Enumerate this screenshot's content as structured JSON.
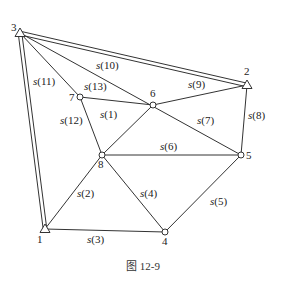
{
  "caption": "图 12-9",
  "points": [
    {
      "id": "1",
      "label": "1",
      "type": "control",
      "x": 45,
      "y": 229,
      "lx": 37,
      "ly": 243
    },
    {
      "id": "2",
      "label": "2",
      "type": "control",
      "x": 247,
      "y": 85,
      "lx": 244,
      "ly": 75
    },
    {
      "id": "3",
      "label": "3",
      "type": "control",
      "x": 20,
      "y": 33,
      "lx": 11,
      "ly": 31
    },
    {
      "id": "4",
      "label": "4",
      "type": "unknown",
      "x": 165,
      "y": 232,
      "lx": 162,
      "ly": 245
    },
    {
      "id": "5",
      "label": "5",
      "type": "unknown",
      "x": 241,
      "y": 155,
      "lx": 246,
      "ly": 159
    },
    {
      "id": "6",
      "label": "6",
      "type": "unknown",
      "x": 153,
      "y": 105,
      "lx": 150,
      "ly": 97
    },
    {
      "id": "7",
      "label": "7",
      "type": "unknown",
      "x": 80,
      "y": 97,
      "lx": 69,
      "ly": 101
    },
    {
      "id": "8",
      "label": "8",
      "type": "unknown",
      "x": 102,
      "y": 155,
      "lx": 98,
      "ly": 168
    }
  ],
  "edges": [
    {
      "from": "7",
      "to": "6",
      "style": "single"
    },
    {
      "from": "6",
      "to": "8",
      "style": "single"
    },
    {
      "from": "8",
      "to": "1",
      "style": "single"
    },
    {
      "from": "1",
      "to": "4",
      "style": "single"
    },
    {
      "from": "8",
      "to": "4",
      "style": "single"
    },
    {
      "from": "4",
      "to": "5",
      "style": "single"
    },
    {
      "from": "8",
      "to": "5",
      "style": "single"
    },
    {
      "from": "3",
      "to": "5",
      "style": "single"
    },
    {
      "from": "6",
      "to": "2",
      "style": "single"
    },
    {
      "from": "5",
      "to": "2",
      "style": "single"
    },
    {
      "from": "3",
      "to": "7",
      "style": "single"
    },
    {
      "from": "7",
      "to": "8",
      "style": "single"
    },
    {
      "from": "3",
      "to": "2",
      "style": "double"
    },
    {
      "from": "3",
      "to": "1",
      "style": "double"
    }
  ],
  "edge_labels": [
    {
      "name": "s",
      "num": "(1)",
      "x": 100,
      "y": 118
    },
    {
      "name": "s",
      "num": "(2)",
      "x": 77,
      "y": 197
    },
    {
      "name": "s",
      "num": "(3)",
      "x": 87,
      "y": 243
    },
    {
      "name": "s",
      "num": "(4)",
      "x": 140,
      "y": 197
    },
    {
      "name": "s",
      "num": "(5)",
      "x": 210,
      "y": 205
    },
    {
      "name": "s",
      "num": "(6)",
      "x": 160,
      "y": 150
    },
    {
      "name": "s",
      "num": "(7)",
      "x": 197,
      "y": 124
    },
    {
      "name": "s",
      "num": "(8)",
      "x": 248,
      "y": 119
    },
    {
      "name": "s",
      "num": "(9)",
      "x": 188,
      "y": 88
    },
    {
      "name": "s",
      "num": "(10)",
      "x": 96,
      "y": 69
    },
    {
      "name": "s",
      "num": "(11)",
      "x": 33,
      "y": 85
    },
    {
      "name": "s",
      "num": "(12)",
      "x": 60,
      "y": 124
    },
    {
      "name": "s",
      "num": "(13)",
      "x": 84,
      "y": 90
    }
  ]
}
